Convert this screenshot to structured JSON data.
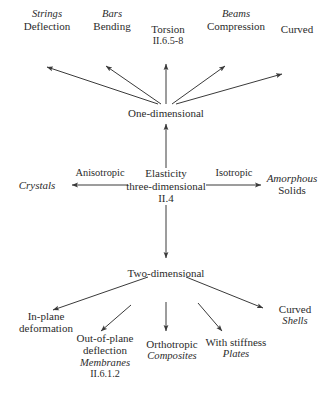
{
  "diagram": {
    "colors": {
      "text": "#2b2b2b",
      "line": "#3a3a3a",
      "background": "#ffffff"
    },
    "nodes": {
      "center": {
        "line1": "Elasticity",
        "line2": "three-dimensional",
        "line3": "II.4"
      },
      "one_dimensional": {
        "label": "One-dimensional"
      },
      "two_dimensional": {
        "label": "Two-dimensional"
      }
    },
    "side_branches": {
      "left": {
        "edge_label": "Anisotropic",
        "target_italic": "Crystals"
      },
      "right": {
        "edge_label": "Isotropic",
        "target_italic": "Amorphous",
        "target_regular": "Solids"
      }
    },
    "one_dimensional_children": [
      {
        "category": "Strings",
        "name": "Deflection",
        "ref": ""
      },
      {
        "category": "Bars",
        "name": "Bending",
        "ref": ""
      },
      {
        "category": "",
        "name": "Torsion",
        "ref": "II.6.5-8"
      },
      {
        "category": "Beams",
        "name": "Compression",
        "ref": ""
      },
      {
        "category": "",
        "name": "Curved",
        "ref": ""
      }
    ],
    "two_dimensional_children": [
      {
        "name1": "In-plane",
        "name2": "deformation",
        "italic": "",
        "ref": ""
      },
      {
        "name1": "Out-of-plane",
        "name2": "deflection",
        "italic": "Membranes",
        "ref": "II.6.1.2"
      },
      {
        "name1": "Orthotropic",
        "name2": "",
        "italic": "Composites",
        "ref": ""
      },
      {
        "name1": "With stiffness",
        "name2": "",
        "italic": "Plates",
        "ref": ""
      },
      {
        "name1": "Curved",
        "name2": "",
        "italic": "Shells",
        "ref": ""
      }
    ]
  }
}
